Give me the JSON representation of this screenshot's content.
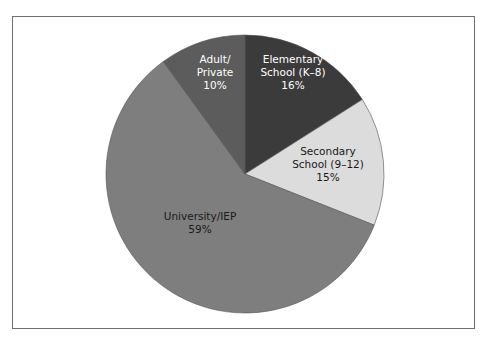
{
  "chart_data": {
    "type": "pie",
    "title": "",
    "start": "12 o'clock",
    "direction": "clockwise",
    "slices": [
      {
        "label": "Elementary School (K–8)",
        "label_lines": [
          "Elementary",
          "School (K–8)",
          "16%"
        ],
        "value": 16,
        "color": "#3b3b3b",
        "text_color": "#ffffff"
      },
      {
        "label": "Secondary School (9–12)",
        "label_lines": [
          "Secondary",
          "School (9–12)",
          "15%"
        ],
        "value": 15,
        "color": "#dcdcdc",
        "text_color": "#1a1a1a"
      },
      {
        "label": "University/IEP",
        "label_lines": [
          "University/IEP",
          "59%"
        ],
        "value": 59,
        "color": "#7e7e7e",
        "text_color": "#1a1a1a"
      },
      {
        "label": "Adult/Private",
        "label_lines": [
          "Adult/",
          "Private",
          "10%"
        ],
        "value": 10,
        "color": "#5c5c5c",
        "text_color": "#ffffff"
      }
    ]
  }
}
